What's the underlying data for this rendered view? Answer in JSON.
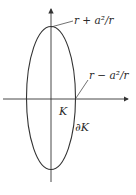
{
  "diagram": {
    "labels": {
      "top": "r + a²/r",
      "right": "r − a²/r",
      "region": "K",
      "boundary": "∂K"
    },
    "colors": {
      "stroke": "#333333",
      "text": "#2a2a2a",
      "background": "#ffffff"
    }
  }
}
